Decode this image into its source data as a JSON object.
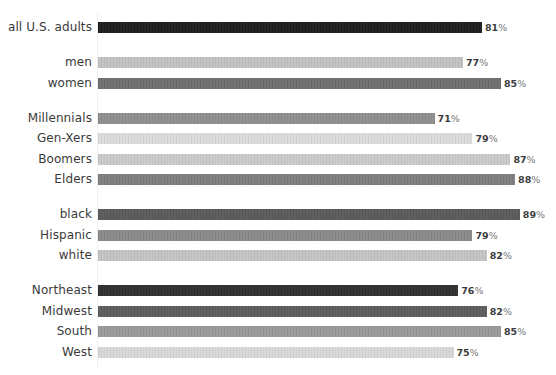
{
  "chart_data": {
    "type": "bar",
    "orientation": "horizontal",
    "title": "",
    "xlabel": "",
    "ylabel": "",
    "xlim": [
      0,
      100
    ],
    "grid": false,
    "legend": null,
    "value_suffix": "%",
    "groups": [
      {
        "name": "overall",
        "categories": [
          "all U.S. adults"
        ]
      },
      {
        "name": "gender",
        "categories": [
          "men",
          "women"
        ]
      },
      {
        "name": "generation",
        "categories": [
          "Millennials",
          "Gen-Xers",
          "Boomers",
          "Elders"
        ]
      },
      {
        "name": "race",
        "categories": [
          "black",
          "Hispanic",
          "white"
        ]
      },
      {
        "name": "region",
        "categories": [
          "Northeast",
          "Midwest",
          "South",
          "West"
        ]
      }
    ],
    "categories": [
      "all U.S. adults",
      "men",
      "women",
      "Millennials",
      "Gen-Xers",
      "Boomers",
      "Elders",
      "black",
      "Hispanic",
      "white",
      "Northeast",
      "Midwest",
      "South",
      "West"
    ],
    "values": [
      81,
      77,
      85,
      71,
      79,
      87,
      88,
      89,
      79,
      82,
      76,
      82,
      85,
      75
    ]
  },
  "rows": [
    {
      "label": "all U.S. adults",
      "value": 81,
      "num": "81",
      "pct": "%",
      "color": "#1c1c1c",
      "y": 22
    },
    {
      "label": "men",
      "value": 77,
      "num": "77",
      "pct": "%",
      "color": "#c2c2c2",
      "y": 57
    },
    {
      "label": "women",
      "value": 85,
      "num": "85",
      "pct": "%",
      "color": "#6e6e6e",
      "y": 78
    },
    {
      "label": "Millennials",
      "value": 71,
      "num": "71",
      "pct": "%",
      "color": "#8e8e8e",
      "y": 113
    },
    {
      "label": "Gen-Xers",
      "value": 79,
      "num": "79",
      "pct": "%",
      "color": "#dcdcdc",
      "y": 133
    },
    {
      "label": "Boomers",
      "value": 87,
      "num": "87",
      "pct": "%",
      "color": "#cacaca",
      "y": 154
    },
    {
      "label": "Elders",
      "value": 88,
      "num": "88",
      "pct": "%",
      "color": "#7e7e7e",
      "y": 174
    },
    {
      "label": "black",
      "value": 89,
      "num": "89",
      "pct": "%",
      "color": "#5a5a5a",
      "y": 209
    },
    {
      "label": "Hispanic",
      "value": 79,
      "num": "79",
      "pct": "%",
      "color": "#8a8a8a",
      "y": 230
    },
    {
      "label": "white",
      "value": 82,
      "num": "82",
      "pct": "%",
      "color": "#c4c4c4",
      "y": 250
    },
    {
      "label": "Northeast",
      "value": 76,
      "num": "76",
      "pct": "%",
      "color": "#2e2e2e",
      "y": 285
    },
    {
      "label": "Midwest",
      "value": 82,
      "num": "82",
      "pct": "%",
      "color": "#5c5c5c",
      "y": 306
    },
    {
      "label": "South",
      "value": 85,
      "num": "85",
      "pct": "%",
      "color": "#999999",
      "y": 326
    },
    {
      "label": "West",
      "value": 75,
      "num": "75",
      "pct": "%",
      "color": "#d8d8d8",
      "y": 347
    }
  ],
  "scale": {
    "px_per_unit": 4.74,
    "origin_x": 98
  }
}
